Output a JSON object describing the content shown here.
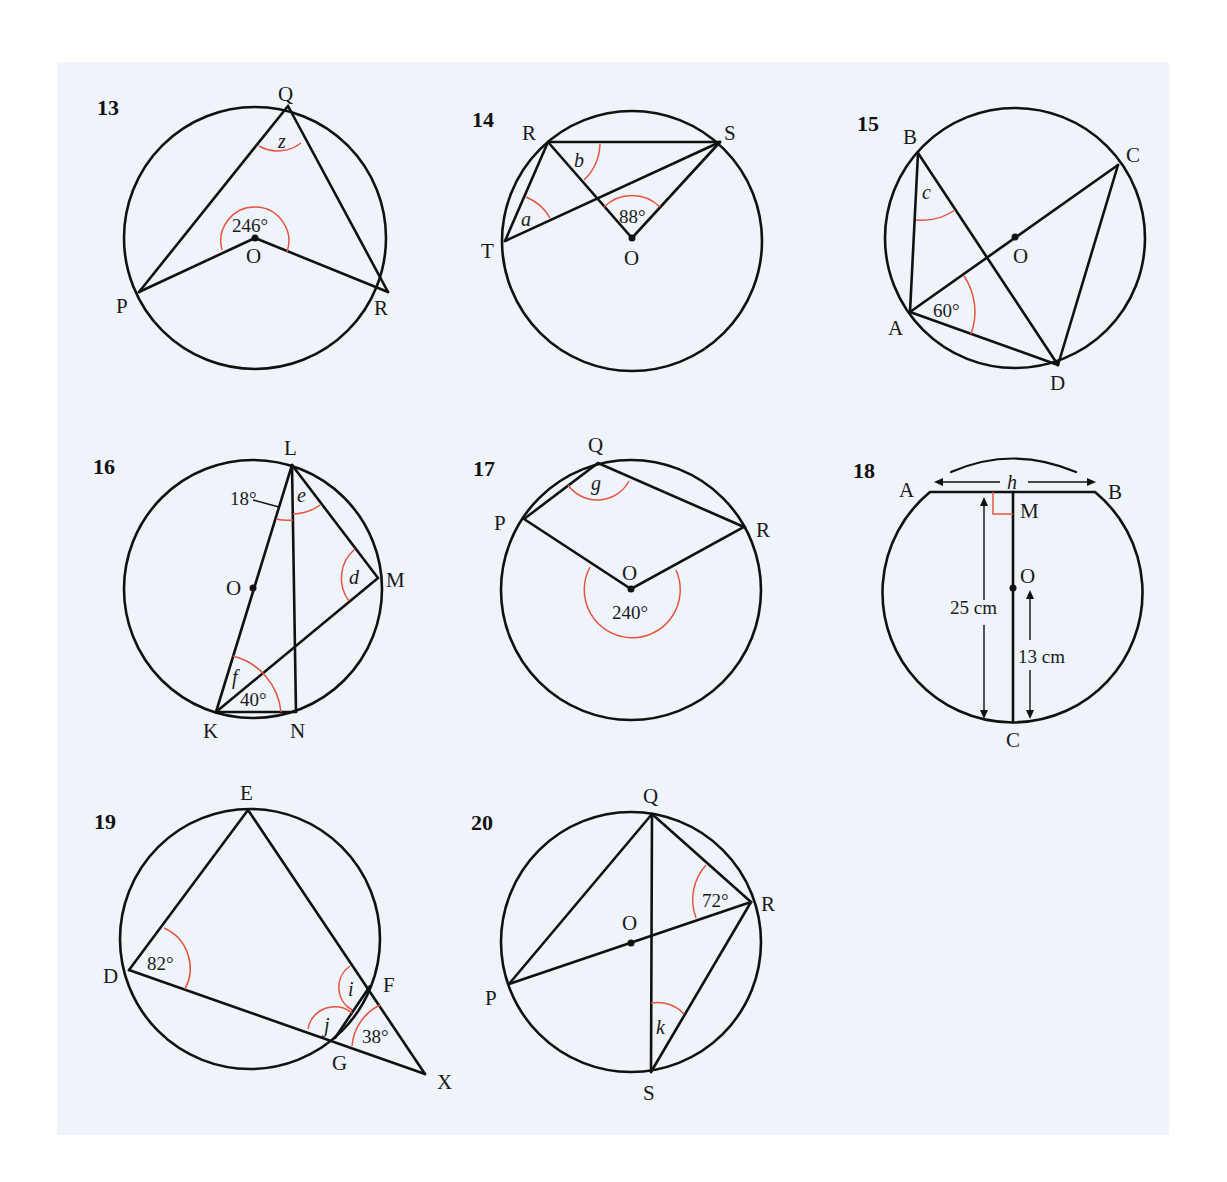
{
  "problems": [
    {
      "number": "13",
      "points": {
        "Q": "Q",
        "P": "P",
        "R": "R",
        "O": "O"
      },
      "angles": {
        "center": "246°",
        "unknown": "z"
      }
    },
    {
      "number": "14",
      "points": {
        "R": "R",
        "S": "S",
        "T": "T",
        "O": "O"
      },
      "angles": {
        "center": "88°",
        "unknown_a": "a",
        "unknown_b": "b"
      }
    },
    {
      "number": "15",
      "points": {
        "B": "B",
        "C": "C",
        "A": "A",
        "D": "D",
        "O": "O"
      },
      "angles": {
        "given": "60°",
        "unknown": "c"
      }
    },
    {
      "number": "16",
      "points": {
        "L": "L",
        "M": "M",
        "K": "K",
        "N": "N",
        "O": "O"
      },
      "angles": {
        "given_top": "18°",
        "given_bottom": "40°",
        "unknown_e": "e",
        "unknown_d": "d",
        "unknown_f": "f"
      }
    },
    {
      "number": "17",
      "points": {
        "Q": "Q",
        "P": "P",
        "R": "R",
        "O": "O"
      },
      "angles": {
        "center": "240°",
        "unknown": "g"
      }
    },
    {
      "number": "18",
      "points": {
        "A": "A",
        "B": "B",
        "M": "M",
        "O": "O",
        "C": "C"
      },
      "lengths": {
        "chord": "h",
        "full": "25 cm",
        "radius": "13 cm"
      }
    },
    {
      "number": "19",
      "points": {
        "E": "E",
        "D": "D",
        "F": "F",
        "G": "G",
        "X": "X"
      },
      "angles": {
        "given_d": "82°",
        "given_x": "38°",
        "unknown_i": "i",
        "unknown_j": "j"
      }
    },
    {
      "number": "20",
      "points": {
        "Q": "Q",
        "R": "R",
        "P": "P",
        "S": "S",
        "O": "O"
      },
      "angles": {
        "given": "72°",
        "unknown": "k"
      }
    }
  ],
  "colors": {
    "background": "#eef4f9",
    "line": "#111111",
    "angle_arc": "#e4553f"
  }
}
